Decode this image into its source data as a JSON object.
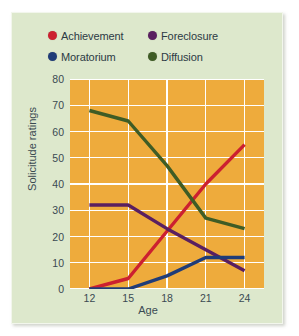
{
  "chart_data": {
    "type": "line",
    "title": "",
    "xlabel": "Age",
    "ylabel": "Solicitude ratings",
    "x": [
      12,
      15,
      18,
      21,
      24
    ],
    "xticklabels": [
      "12",
      "15",
      "18",
      "21",
      "24"
    ],
    "yticklabels": [
      "0",
      "10",
      "20",
      "30",
      "40",
      "50",
      "60",
      "70",
      "80"
    ],
    "xlim": [
      10.5,
      25.5
    ],
    "ylim": [
      0,
      80
    ],
    "grid": true,
    "legend_position": "top",
    "series": [
      {
        "name": "Achievement",
        "color": "#cc2030",
        "values": [
          0,
          4,
          22,
          40,
          55
        ]
      },
      {
        "name": "Foreclosure",
        "color": "#5a1f60",
        "values": [
          32,
          32,
          23,
          15,
          7
        ]
      },
      {
        "name": "Moratorium",
        "color": "#1f3c78",
        "values": [
          0,
          0,
          5,
          12,
          12
        ]
      },
      {
        "name": "Diffusion",
        "color": "#3f5c25",
        "values": [
          68,
          64,
          47,
          27,
          23
        ]
      }
    ]
  },
  "legend": {
    "rows": [
      [
        {
          "label": "Achievement",
          "color": "#cc2030",
          "icon": "legend-dot-achievement"
        },
        {
          "label": "Foreclosure",
          "color": "#5a1f60",
          "icon": "legend-dot-foreclosure"
        }
      ],
      [
        {
          "label": "Moratorium",
          "color": "#1f3c78",
          "icon": "legend-dot-moratorium"
        },
        {
          "label": "Diffusion",
          "color": "#3f5c25",
          "icon": "legend-dot-diffusion"
        }
      ]
    ]
  },
  "colors": {
    "card_background": "#dde8cc",
    "plot_background": "#eeab3c",
    "gridline": "#ffffff",
    "text": "#3a4a52"
  }
}
